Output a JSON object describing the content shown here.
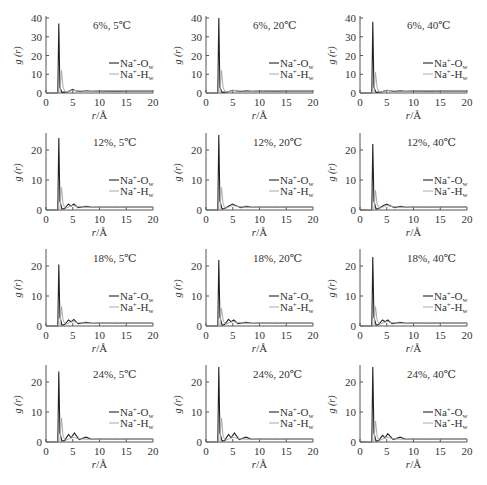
{
  "figure": {
    "rows": [
      "6%",
      "12%",
      "18%",
      "24%"
    ],
    "cols": [
      "5℃",
      "20℃",
      "40℃"
    ]
  },
  "colors": {
    "na_ow": "#222222",
    "na_hw": "#aaaaaa",
    "axis": "#555555"
  },
  "chart_data": [
    {
      "type": "line",
      "title": "6%, 5℃",
      "xlabel": "r/Å",
      "ylabel": "g (r)",
      "xlim": [
        0,
        20
      ],
      "ylim": [
        0,
        40
      ],
      "yticks": [
        0,
        10,
        20,
        30,
        40
      ],
      "xticks": [
        0,
        5,
        10,
        15,
        20
      ],
      "legend": [
        "Na⁺-O_w",
        "Na⁺-H_w"
      ],
      "series": [
        {
          "name": "Na⁺-O_w",
          "x": [
            0,
            2.2,
            2.4,
            2.6,
            3.0,
            4.0,
            5.0,
            5.5,
            6.5,
            7.5,
            8.5,
            10,
            15,
            20
          ],
          "y": [
            0,
            0,
            37,
            3,
            0.3,
            0.6,
            2,
            1.2,
            0.8,
            1.2,
            0.9,
            1,
            1,
            1
          ]
        },
        {
          "name": "Na⁺-H_w",
          "x": [
            0,
            2.6,
            2.9,
            3.2,
            3.6,
            4.5,
            5.0,
            6,
            8,
            10,
            13,
            15,
            20
          ],
          "y": [
            0,
            0,
            12,
            3,
            0.5,
            1,
            1.5,
            1.1,
            0.9,
            1,
            1.3,
            1,
            1
          ]
        }
      ]
    },
    {
      "type": "line",
      "title": "6%, 20℃",
      "xlabel": "r/Å",
      "ylabel": "g (r)",
      "xlim": [
        0,
        20
      ],
      "ylim": [
        0,
        40
      ],
      "yticks": [
        0,
        10,
        20,
        30,
        40
      ],
      "xticks": [
        0,
        5,
        10,
        15,
        20
      ],
      "legend": [
        "Na⁺-O_w",
        "Na⁺-H_w"
      ],
      "series": [
        {
          "name": "Na⁺-O_w",
          "x": [
            0,
            2.2,
            2.4,
            2.6,
            3.0,
            4.0,
            5.0,
            5.5,
            6.5,
            7.5,
            8.5,
            10,
            15,
            20
          ],
          "y": [
            0,
            0,
            40,
            3,
            0.3,
            0.6,
            1.5,
            1.2,
            0.8,
            1.1,
            0.9,
            1,
            1,
            1
          ]
        },
        {
          "name": "Na⁺-H_w",
          "x": [
            0,
            2.6,
            2.9,
            3.2,
            3.6,
            4.5,
            5.0,
            6,
            8,
            10,
            13,
            15,
            20
          ],
          "y": [
            0,
            0,
            12,
            3,
            0.5,
            1,
            1.3,
            1.1,
            0.9,
            1,
            1.2,
            1,
            1
          ]
        }
      ]
    },
    {
      "type": "line",
      "title": "6%, 40℃",
      "xlabel": "r/Å",
      "ylabel": "g (r)",
      "xlim": [
        0,
        20
      ],
      "ylim": [
        0,
        40
      ],
      "yticks": [
        0,
        10,
        20,
        30,
        40
      ],
      "xticks": [
        0,
        5,
        10,
        15,
        20
      ],
      "legend": [
        "Na⁺-O_w",
        "Na⁺-H_w"
      ],
      "series": [
        {
          "name": "Na⁺-O_w",
          "x": [
            0,
            2.2,
            2.4,
            2.6,
            3.0,
            4.0,
            5.0,
            5.5,
            6.5,
            7.5,
            8.5,
            10,
            15,
            20
          ],
          "y": [
            0,
            0,
            38,
            3,
            0.3,
            0.6,
            1.5,
            1.2,
            0.8,
            1.1,
            0.9,
            1,
            1,
            1
          ]
        },
        {
          "name": "Na⁺-H_w",
          "x": [
            0,
            2.6,
            2.9,
            3.2,
            3.6,
            4.5,
            5.0,
            6,
            8,
            10,
            13,
            15,
            20
          ],
          "y": [
            0,
            0,
            11,
            3,
            0.5,
            1,
            1.3,
            1.1,
            0.9,
            1,
            1.2,
            1,
            1
          ]
        }
      ]
    },
    {
      "type": "line",
      "title": "12%, 5℃",
      "xlabel": "r/Å",
      "ylabel": "g (r)",
      "xlim": [
        0,
        20
      ],
      "ylim": [
        0,
        25
      ],
      "yticks": [
        0,
        10,
        20
      ],
      "xticks": [
        0,
        5,
        10,
        15,
        20
      ],
      "legend": [
        "Na⁺-O_w",
        "Na⁺-H_w"
      ],
      "series": [
        {
          "name": "Na⁺-O_w",
          "x": [
            0,
            2.2,
            2.4,
            2.6,
            3.0,
            3.5,
            4.2,
            4.7,
            5.2,
            6.0,
            7.5,
            8.5,
            10,
            15,
            20
          ],
          "y": [
            0,
            0,
            24,
            3,
            0.3,
            0.5,
            2,
            1.3,
            2,
            0.8,
            1.2,
            0.9,
            1,
            1,
            1
          ]
        },
        {
          "name": "Na⁺-H_w",
          "x": [
            0,
            2.6,
            2.9,
            3.2,
            3.6,
            4.5,
            5.0,
            6,
            8,
            10,
            13,
            15,
            20
          ],
          "y": [
            0,
            0,
            7.5,
            2,
            0.5,
            1.2,
            1.5,
            1.1,
            0.9,
            1,
            1.2,
            1,
            1
          ]
        }
      ]
    },
    {
      "type": "line",
      "title": "12%, 20℃",
      "xlabel": "r/Å",
      "ylabel": "g (r)",
      "xlim": [
        0,
        20
      ],
      "ylim": [
        0,
        25
      ],
      "yticks": [
        0,
        10,
        20
      ],
      "xticks": [
        0,
        5,
        10,
        15,
        20
      ],
      "legend": [
        "Na⁺-O_w",
        "Na⁺-H_w"
      ],
      "series": [
        {
          "name": "Na⁺-O_w",
          "x": [
            0,
            2.2,
            2.4,
            2.6,
            3.0,
            3.5,
            4.5,
            5.0,
            5.5,
            6.5,
            7.5,
            8.5,
            10,
            15,
            20
          ],
          "y": [
            0,
            0,
            25,
            3,
            0.3,
            0.5,
            1.6,
            2,
            1.5,
            0.8,
            1.2,
            0.9,
            1,
            1,
            1
          ]
        },
        {
          "name": "Na⁺-H_w",
          "x": [
            0,
            2.6,
            2.9,
            3.2,
            3.6,
            4.5,
            5.0,
            6,
            8,
            10,
            13,
            15,
            20
          ],
          "y": [
            0,
            0,
            7.5,
            2,
            0.5,
            1.2,
            1.5,
            1.1,
            0.9,
            1,
            1.2,
            1,
            1
          ]
        }
      ]
    },
    {
      "type": "line",
      "title": "12%, 40℃",
      "xlabel": "r/Å",
      "ylabel": "g (r)",
      "xlim": [
        0,
        20
      ],
      "ylim": [
        0,
        25
      ],
      "yticks": [
        0,
        10,
        20
      ],
      "xticks": [
        0,
        5,
        10,
        15,
        20
      ],
      "legend": [
        "Na⁺-O_w",
        "Na⁺-H_w"
      ],
      "series": [
        {
          "name": "Na⁺-O_w",
          "x": [
            0,
            2.2,
            2.4,
            2.6,
            3.0,
            3.5,
            4.5,
            5.0,
            5.5,
            6.5,
            7.5,
            8.5,
            10,
            15,
            20
          ],
          "y": [
            0,
            0,
            22,
            3,
            0.3,
            0.5,
            1.6,
            2,
            1.5,
            0.8,
            1.2,
            0.9,
            1,
            1,
            1
          ]
        },
        {
          "name": "Na⁺-H_w",
          "x": [
            0,
            2.6,
            2.9,
            3.2,
            3.6,
            4.5,
            5.0,
            6,
            8,
            10,
            13,
            15,
            20
          ],
          "y": [
            0,
            0,
            6.5,
            2,
            0.5,
            1.2,
            1.5,
            1.1,
            0.9,
            1,
            1.2,
            1,
            1
          ]
        }
      ]
    },
    {
      "type": "line",
      "title": "18%, 5℃",
      "xlabel": "r/Å",
      "ylabel": "g (r)",
      "xlim": [
        0,
        20
      ],
      "ylim": [
        0,
        25
      ],
      "yticks": [
        0,
        10,
        20
      ],
      "xticks": [
        0,
        5,
        10,
        15,
        20
      ],
      "legend": [
        "Na⁺-O_w",
        "Na⁺-H_w"
      ],
      "series": [
        {
          "name": "Na⁺-O_w",
          "x": [
            0,
            2.2,
            2.4,
            2.6,
            3.0,
            3.5,
            4.2,
            4.7,
            5.2,
            6.0,
            7.5,
            8.5,
            10,
            15,
            20
          ],
          "y": [
            0,
            0,
            20.5,
            3,
            0.3,
            0.5,
            2,
            1.4,
            2.2,
            0.8,
            1.2,
            0.9,
            1,
            1,
            1
          ]
        },
        {
          "name": "Na⁺-H_w",
          "x": [
            0,
            2.6,
            2.9,
            3.2,
            3.6,
            4.5,
            5.0,
            6,
            8,
            10,
            13,
            15,
            20
          ],
          "y": [
            0,
            0,
            6.5,
            2,
            0.5,
            1.2,
            1.5,
            1.1,
            0.9,
            1,
            1.2,
            1,
            1
          ]
        }
      ]
    },
    {
      "type": "line",
      "title": "18%, 20℃",
      "xlabel": "r/Å",
      "ylabel": "g (r)",
      "xlim": [
        0,
        20
      ],
      "ylim": [
        0,
        25
      ],
      "yticks": [
        0,
        10,
        20
      ],
      "xticks": [
        0,
        5,
        10,
        15,
        20
      ],
      "legend": [
        "Na⁺-O_w",
        "Na⁺-H_w"
      ],
      "series": [
        {
          "name": "Na⁺-O_w",
          "x": [
            0,
            2.2,
            2.4,
            2.6,
            3.0,
            3.5,
            4.2,
            4.7,
            5.2,
            6.0,
            7.5,
            8.5,
            10,
            15,
            20
          ],
          "y": [
            0,
            0,
            22,
            3,
            0.3,
            0.5,
            2.2,
            1.4,
            2,
            0.8,
            1.2,
            0.9,
            1,
            1,
            1
          ]
        },
        {
          "name": "Na⁺-H_w",
          "x": [
            0,
            2.6,
            2.9,
            3.2,
            3.6,
            4.5,
            5.0,
            6,
            8,
            10,
            13,
            15,
            20
          ],
          "y": [
            0,
            0,
            6,
            2,
            0.5,
            1.2,
            1.5,
            1.1,
            0.9,
            1,
            1.2,
            1,
            1
          ]
        }
      ]
    },
    {
      "type": "line",
      "title": "18%, 40℃",
      "xlabel": "r/Å",
      "ylabel": "g (r)",
      "xlim": [
        0,
        20
      ],
      "ylim": [
        0,
        25
      ],
      "yticks": [
        0,
        10,
        20
      ],
      "xticks": [
        0,
        5,
        10,
        15,
        20
      ],
      "legend": [
        "Na⁺-O_w",
        "Na⁺-H_w"
      ],
      "series": [
        {
          "name": "Na⁺-O_w",
          "x": [
            0,
            2.2,
            2.4,
            2.6,
            3.0,
            3.5,
            4.2,
            4.7,
            5.2,
            6.0,
            7.5,
            8.5,
            10,
            15,
            20
          ],
          "y": [
            0,
            0,
            23,
            3,
            0.3,
            0.5,
            2,
            1.4,
            2,
            0.8,
            1.2,
            0.9,
            1,
            1,
            1
          ]
        },
        {
          "name": "Na⁺-H_w",
          "x": [
            0,
            2.6,
            2.9,
            3.2,
            3.6,
            4.5,
            5.0,
            6,
            8,
            10,
            13,
            15,
            20
          ],
          "y": [
            0,
            0,
            6.5,
            2,
            0.5,
            1.2,
            1.5,
            1.1,
            0.9,
            1,
            1.2,
            1,
            1
          ]
        }
      ]
    },
    {
      "type": "line",
      "title": "24%, 5℃",
      "xlabel": "r/Å",
      "ylabel": "g (r)",
      "xlim": [
        0,
        20
      ],
      "ylim": [
        0,
        25
      ],
      "yticks": [
        0,
        10,
        20
      ],
      "xticks": [
        0,
        5,
        10,
        15,
        20
      ],
      "legend": [
        "Na⁺-O_w",
        "Na⁺-H_w"
      ],
      "series": [
        {
          "name": "Na⁺-O_w",
          "x": [
            0,
            2.2,
            2.4,
            2.6,
            3.0,
            3.5,
            4.2,
            4.7,
            5.3,
            6.2,
            7.5,
            8.5,
            10,
            15,
            20
          ],
          "y": [
            0,
            0,
            23.5,
            3,
            0.3,
            0.5,
            2.5,
            1.4,
            3,
            0.8,
            1.6,
            0.9,
            1,
            1,
            1
          ]
        },
        {
          "name": "Na⁺-H_w",
          "x": [
            0,
            2.6,
            2.9,
            3.2,
            3.6,
            4.5,
            5.0,
            6,
            8,
            10,
            13,
            15,
            20
          ],
          "y": [
            0,
            0,
            8,
            2,
            0.5,
            1.2,
            1.6,
            1.1,
            0.9,
            1,
            1.2,
            1,
            1
          ]
        }
      ]
    },
    {
      "type": "line",
      "title": "24%, 20℃",
      "xlabel": "r/Å",
      "ylabel": "g (r)",
      "xlim": [
        0,
        20
      ],
      "ylim": [
        0,
        25
      ],
      "yticks": [
        0,
        10,
        20
      ],
      "xticks": [
        0,
        5,
        10,
        15,
        20
      ],
      "legend": [
        "Na⁺-O_w",
        "Na⁺-H_w"
      ],
      "series": [
        {
          "name": "Na⁺-O_w",
          "x": [
            0,
            2.2,
            2.4,
            2.6,
            3.0,
            3.5,
            4.2,
            4.7,
            5.3,
            6.2,
            7.5,
            8.5,
            10,
            15,
            20
          ],
          "y": [
            0,
            0,
            25,
            3,
            0.3,
            0.5,
            2.5,
            1.4,
            3,
            0.8,
            1.6,
            0.9,
            1,
            1,
            1
          ]
        },
        {
          "name": "Na⁺-H_w",
          "x": [
            0,
            2.6,
            2.9,
            3.2,
            3.6,
            4.5,
            5.0,
            6,
            8,
            10,
            13,
            15,
            20
          ],
          "y": [
            0,
            0,
            8,
            2,
            0.5,
            1.2,
            1.6,
            1.1,
            0.9,
            1,
            1.2,
            1,
            1
          ]
        }
      ]
    },
    {
      "type": "line",
      "title": "24%, 40℃",
      "xlabel": "r/Å",
      "ylabel": "g (r)",
      "xlim": [
        0,
        20
      ],
      "ylim": [
        0,
        25
      ],
      "yticks": [
        0,
        10,
        20
      ],
      "xticks": [
        0,
        5,
        10,
        15,
        20
      ],
      "legend": [
        "Na⁺-O_w",
        "Na⁺-H_w"
      ],
      "series": [
        {
          "name": "Na⁺-O_w",
          "x": [
            0,
            2.2,
            2.4,
            2.6,
            3.0,
            3.5,
            4.2,
            4.7,
            5.2,
            6.2,
            7.5,
            8.5,
            10,
            15,
            20
          ],
          "y": [
            0,
            0,
            25,
            3,
            0.3,
            0.5,
            2.2,
            1.4,
            2.8,
            0.8,
            1.6,
            0.9,
            1,
            1,
            1
          ]
        },
        {
          "name": "Na⁺-H_w",
          "x": [
            0,
            2.6,
            2.9,
            3.2,
            3.6,
            4.5,
            5.0,
            6,
            8,
            10,
            13,
            15,
            20
          ],
          "y": [
            0,
            0,
            7,
            2,
            0.5,
            1.2,
            1.6,
            1.1,
            0.9,
            1,
            1.2,
            1,
            1
          ]
        }
      ]
    }
  ]
}
